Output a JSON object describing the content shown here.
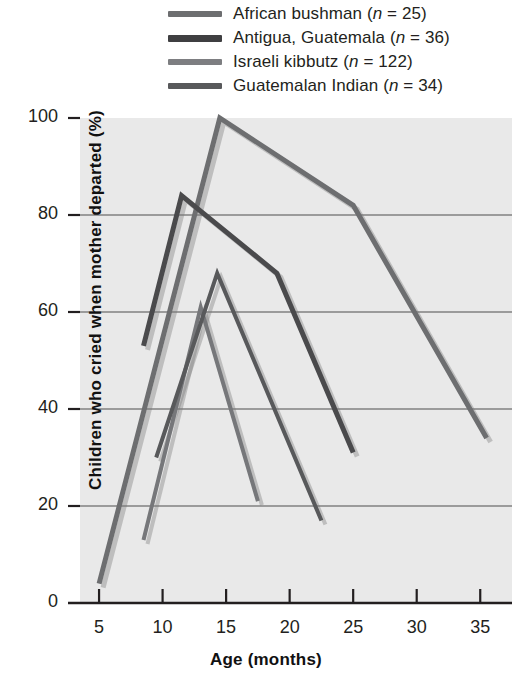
{
  "chart_data": {
    "type": "line",
    "title": "",
    "xlabel": "Age (months)",
    "ylabel": "Children who cried when mother departed (%)",
    "xlim": [
      3.5,
      37.5
    ],
    "ylim": [
      0,
      100
    ],
    "xticks": [
      5,
      10,
      15,
      20,
      25,
      30,
      35
    ],
    "yticks": [
      0,
      20,
      40,
      60,
      80,
      100
    ],
    "grid": "horizontal",
    "legend_position": "top",
    "series": [
      {
        "name": "African bushman",
        "n": 25,
        "label": "African bushman (n = 25)",
        "color": "#6d6e70",
        "width": 5,
        "x": [
          5,
          14.5,
          25,
          35.5
        ],
        "y": [
          4,
          100,
          82,
          34
        ]
      },
      {
        "name": "Antigua, Guatemala",
        "n": 36,
        "label": "Antigua, Guatemala (n = 36)",
        "color": "#4a4a4c",
        "width": 5,
        "x": [
          8.5,
          11.5,
          19,
          25
        ],
        "y": [
          53,
          84,
          68,
          31
        ]
      },
      {
        "name": "Israeli kibbutz",
        "n": 122,
        "label": "Israeli kibbutz (n = 122)",
        "color": "#76777a",
        "width": 4,
        "x": [
          8.5,
          13,
          17.5
        ],
        "y": [
          13,
          61,
          21
        ]
      },
      {
        "name": "Guatemalan Indian",
        "n": 34,
        "label": "Guatemalan Indian (n = 34)",
        "color": "#58595b",
        "width": 4,
        "x": [
          9.5,
          14.3,
          22.5
        ],
        "y": [
          30,
          68,
          17
        ]
      }
    ]
  },
  "legend": {
    "entries": [
      {
        "label": "African bushman (",
        "italic": "n",
        "tail": " = 25)",
        "color": "#6d6e70"
      },
      {
        "label": "Antigua, Guatemala (",
        "italic": "n",
        "tail": " = 36)",
        "color": "#4a4a4c"
      },
      {
        "label": "Israeli kibbutz (",
        "italic": "n",
        "tail": " = 122)",
        "color": "#76777a"
      },
      {
        "label": "Guatemalan Indian (",
        "italic": "n",
        "tail": " = 34)",
        "color": "#58595b"
      }
    ],
    "rows": [
      {
        "pre": "African bushman (",
        "em": "n",
        "post": " = 25)"
      },
      {
        "pre": "Antigua, Guatemala (",
        "em": "n",
        "post": " = 36)"
      },
      {
        "pre": "Israeli kibbutz (",
        "em": "n",
        "post": " = 122)"
      },
      {
        "pre": "Guatemalan Indian (",
        "em": "n",
        "post": " = 34)"
      }
    ]
  },
  "axis_labels": {
    "x": "Age (months)",
    "y": "Children who cried when mother departed (%)"
  },
  "ytick_labels": [
    "100",
    "80",
    "60",
    "40",
    "20",
    "0"
  ],
  "xtick_labels": [
    "5",
    "10",
    "15",
    "20",
    "25",
    "30",
    "35"
  ],
  "colors": {
    "plot_background": "#e9e9e9",
    "gridline": "#808080",
    "axis": "#231f20",
    "text": "#231f20"
  }
}
